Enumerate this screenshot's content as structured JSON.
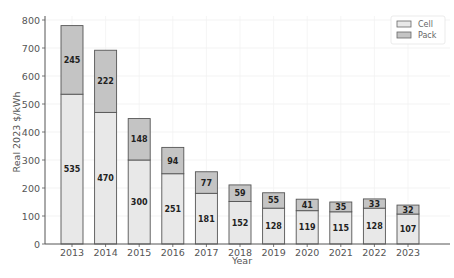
{
  "chart_data": {
    "type": "bar",
    "stacked": true,
    "title": "",
    "xlabel": "Year",
    "ylabel": "Real 2023 $/kWh",
    "ylim": [
      0,
      800
    ],
    "yticks": [
      0,
      100,
      200,
      300,
      400,
      500,
      600,
      700,
      800
    ],
    "grid": true,
    "legend_position": "upper right",
    "categories": [
      "2013",
      "2014",
      "2015",
      "2016",
      "2017",
      "2018",
      "2019",
      "2020",
      "2021",
      "2022",
      "2023"
    ],
    "series": [
      {
        "name": "Cell",
        "color": "#e8e8e8",
        "values": [
          535,
          470,
          300,
          251,
          181,
          152,
          128,
          119,
          115,
          128,
          107
        ]
      },
      {
        "name": "Pack",
        "color": "#c4c4c4",
        "values": [
          245,
          222,
          148,
          94,
          77,
          59,
          55,
          41,
          35,
          33,
          32
        ]
      }
    ]
  },
  "legend": {
    "items": [
      "Cell",
      "Pack"
    ]
  },
  "axes": {
    "xlabel": "Year",
    "ylabel": "Real 2023 $/kWh"
  }
}
